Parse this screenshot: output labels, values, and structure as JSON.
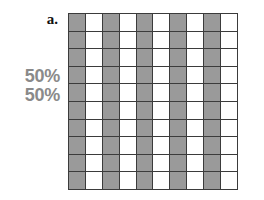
{
  "panel": {
    "letter": "a."
  },
  "labels": {
    "percent_lines": [
      "50%",
      "50%"
    ]
  },
  "colors": {
    "shaded_cell": "#9a9a9a",
    "empty_cell": "#ffffff",
    "grid_line": "#3b3b3b",
    "percent_text": "#8a8a8a",
    "letter_text": "#111111",
    "background": "#ffffff"
  },
  "chart_data": {
    "type": "heatmap",
    "title": "a.",
    "rows": 10,
    "columns": 10,
    "total_cells": 100,
    "shaded_cells": 50,
    "unshaded_cells": 50,
    "shaded_fraction": "50%",
    "pattern": "vertical-stripes-alternating-columns-starting-shaded",
    "shaded_column_indices": [
      0,
      2,
      4,
      6,
      8
    ],
    "annotations": [
      "50%",
      "50%"
    ],
    "cells": [
      [
        1,
        0,
        1,
        0,
        1,
        0,
        1,
        0,
        1,
        0
      ],
      [
        1,
        0,
        1,
        0,
        1,
        0,
        1,
        0,
        1,
        0
      ],
      [
        1,
        0,
        1,
        0,
        1,
        0,
        1,
        0,
        1,
        0
      ],
      [
        1,
        0,
        1,
        0,
        1,
        0,
        1,
        0,
        1,
        0
      ],
      [
        1,
        0,
        1,
        0,
        1,
        0,
        1,
        0,
        1,
        0
      ],
      [
        1,
        0,
        1,
        0,
        1,
        0,
        1,
        0,
        1,
        0
      ],
      [
        1,
        0,
        1,
        0,
        1,
        0,
        1,
        0,
        1,
        0
      ],
      [
        1,
        0,
        1,
        0,
        1,
        0,
        1,
        0,
        1,
        0
      ],
      [
        1,
        0,
        1,
        0,
        1,
        0,
        1,
        0,
        1,
        0
      ],
      [
        1,
        0,
        1,
        0,
        1,
        0,
        1,
        0,
        1,
        0
      ]
    ],
    "grid": true,
    "xlabel": "",
    "ylabel": "",
    "legend": []
  }
}
